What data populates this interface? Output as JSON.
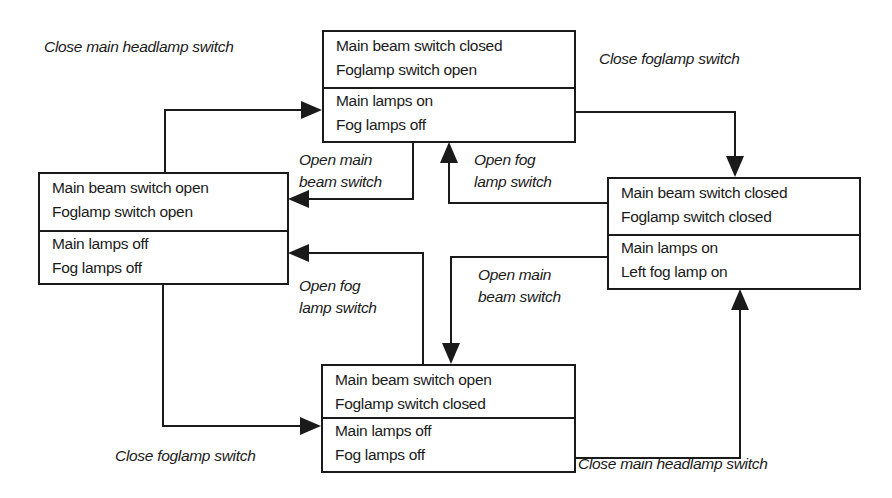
{
  "diagram": {
    "type": "state-transition",
    "states": [
      {
        "id": "main-on-fog-off",
        "inputs": [
          "Main beam switch closed",
          "Foglamp switch open"
        ],
        "outputs": [
          "Main lamps on",
          "Fog lamps off"
        ]
      },
      {
        "id": "all-off",
        "inputs": [
          "Main beam switch open",
          "Foglamp switch open"
        ],
        "outputs": [
          "Main lamps off",
          "Fog lamps off"
        ]
      },
      {
        "id": "main-on-fog-on",
        "inputs": [
          "Main beam switch closed",
          "Foglamp switch closed"
        ],
        "outputs": [
          "Main lamps on",
          "Left fog lamp on"
        ]
      },
      {
        "id": "fog-switch-only",
        "inputs": [
          "Main beam switch open",
          "Foglamp switch closed"
        ],
        "outputs": [
          "Main lamps off",
          "Fog lamps off"
        ]
      }
    ],
    "transitions": [
      {
        "from": "all-off",
        "to": "main-on-fog-off",
        "label": [
          "Close main headlamp switch"
        ]
      },
      {
        "from": "main-on-fog-off",
        "to": "all-off",
        "label": [
          "Open main",
          "beam switch"
        ]
      },
      {
        "from": "main-on-fog-on",
        "to": "main-on-fog-off",
        "label": [
          "Open fog",
          "lamp switch"
        ]
      },
      {
        "from": "main-on-fog-off",
        "to": "main-on-fog-on",
        "label": [
          "Close foglamp switch"
        ]
      },
      {
        "from": "fog-switch-only",
        "to": "all-off",
        "label": [
          "Open fog",
          "lamp switch"
        ]
      },
      {
        "from": "main-on-fog-on",
        "to": "fog-switch-only",
        "label": [
          "Open main",
          "beam switch"
        ]
      },
      {
        "from": "all-off",
        "to": "fog-switch-only",
        "label": [
          "Close foglamp switch"
        ]
      },
      {
        "from": "fog-switch-only",
        "to": "main-on-fog-on",
        "label": [
          "Close main headlamp switch"
        ]
      }
    ],
    "colors": {
      "line": "#1a1a1a",
      "background": "#ffffff"
    }
  }
}
